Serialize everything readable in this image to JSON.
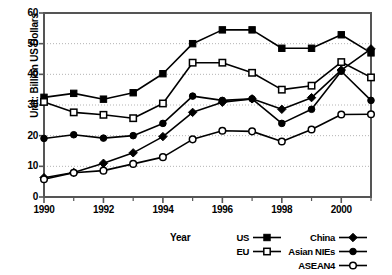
{
  "chart_data": {
    "type": "line",
    "title": "",
    "xlabel": "Year",
    "ylabel": "Unit: Billion US Dollars",
    "x": [
      1990,
      1991,
      1992,
      1993,
      1994,
      1995,
      1996,
      1997,
      1998,
      1999,
      2000,
      2001
    ],
    "xlim": [
      1990,
      2001
    ],
    "ylim": [
      0,
      60
    ],
    "yticks": [
      0,
      10,
      20,
      30,
      40,
      50,
      60
    ],
    "xticks": [
      1990,
      1992,
      1994,
      1996,
      1998,
      2000
    ],
    "xtick_labels": [
      "1990",
      "1992",
      "1994",
      "1996",
      "1998",
      "2000"
    ],
    "ytick_labels": [
      "0",
      "10",
      "20",
      "30",
      "40",
      "50",
      "60"
    ],
    "grid": true,
    "grid_axis": "y",
    "legend_position": "below-right",
    "series": [
      {
        "name": "US",
        "marker": "filled-square",
        "values": [
          32.5,
          33.8,
          31.9,
          34.0,
          40.2,
          50.0,
          54.5,
          54.5,
          48.5,
          48.5,
          52.9,
          47.0
        ]
      },
      {
        "name": "EU",
        "marker": "open-square",
        "values": [
          31.0,
          27.6,
          26.8,
          25.7,
          30.5,
          43.8,
          43.8,
          40.5,
          35.0,
          36.3,
          44.0,
          39.0
        ]
      },
      {
        "name": "China",
        "marker": "filled-diamond",
        "values": [
          6.3,
          8.0,
          11.0,
          14.4,
          19.7,
          27.6,
          30.9,
          32.0,
          28.6,
          32.4,
          41.4,
          48.3
        ]
      },
      {
        "name": "Asian NIEs",
        "marker": "filled-circle",
        "values": [
          19.1,
          20.3,
          19.2,
          20.0,
          24.0,
          32.9,
          31.5,
          32.0,
          24.0,
          28.6,
          41.0,
          31.5
        ]
      },
      {
        "name": "ASEAN4",
        "marker": "open-circle",
        "values": [
          5.8,
          7.9,
          8.6,
          10.8,
          13.0,
          18.8,
          21.6,
          21.4,
          18.1,
          22.0,
          26.9,
          27.0
        ]
      }
    ],
    "legend_entries": [
      {
        "label": "US",
        "marker": "filled-square",
        "col": 0,
        "row": 0
      },
      {
        "label": "EU",
        "marker": "open-square",
        "col": 0,
        "row": 1
      },
      {
        "label": "China",
        "marker": "filled-diamond",
        "col": 1,
        "row": 0
      },
      {
        "label": "Asian NIEs",
        "marker": "filled-circle",
        "col": 1,
        "row": 1
      },
      {
        "label": "ASEAN4",
        "marker": "open-circle",
        "col": 1,
        "row": 2
      }
    ],
    "colors": {
      "line": "#000000",
      "grid": "#b4b4b4",
      "axis": "#555555",
      "background": "#ffffff",
      "marker_fill_open": "#ffffff"
    }
  }
}
